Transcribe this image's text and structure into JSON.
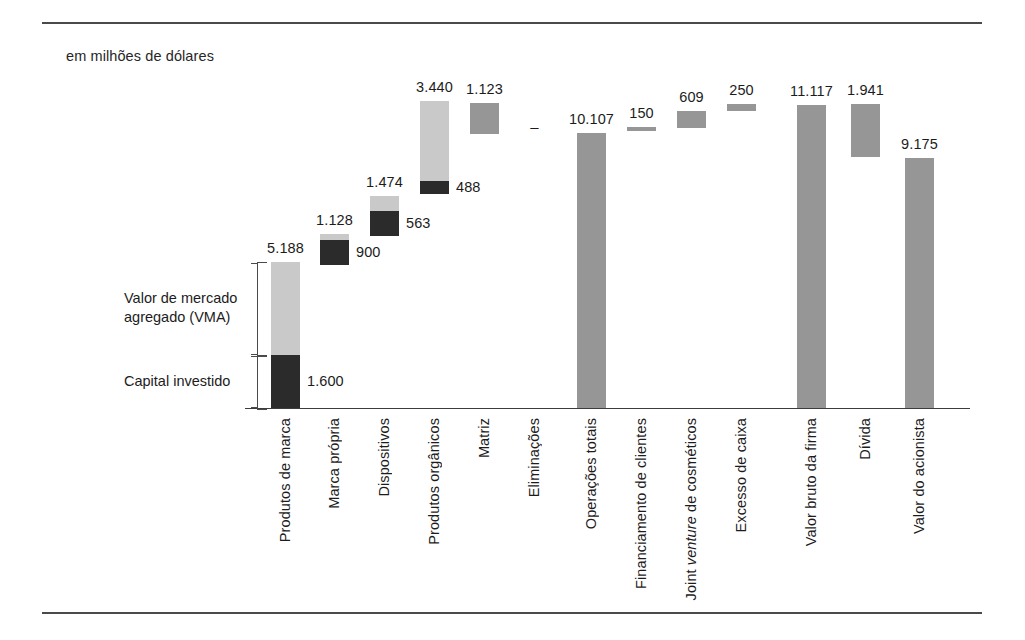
{
  "figure": {
    "unit_note": "em milhões de dólares",
    "baseline_value": 0,
    "legend": [
      {
        "key": "mva",
        "label": "Valor de mercado\nagregado (VMA)",
        "color": "#c9c9c9"
      },
      {
        "key": "cap",
        "label": "Capital investido",
        "color": "#2b2b2b"
      }
    ]
  },
  "chart_data": {
    "type": "bar",
    "title": "",
    "subtitle": "em milhões de dólares",
    "xlabel": "",
    "ylabel": "",
    "ylim": [
      0,
      11117
    ],
    "grid": false,
    "legend_position": "left-inside",
    "stacked": true,
    "value_format": "1.234 (ponto como separador de milhar)",
    "categories": [
      "Produtos de marca",
      "Marca própria",
      "Dispositivos",
      "Produtos orgânicos",
      "Matriz",
      "Eliminações",
      "Operações totais",
      "Financiamento de clientes",
      "Joint venture de cosméticos",
      "Excesso de caixa",
      "Valor bruto da firma",
      "Dívida",
      "Valor do acionista"
    ],
    "series": [
      {
        "name": "Valor de mercado agregado (VMA)",
        "color": "#c9c9c9",
        "values": [
          3588,
          228,
          911,
          2952,
          null,
          null,
          null,
          null,
          null,
          null,
          null,
          null,
          null
        ]
      },
      {
        "name": "Capital investido",
        "color": "#2b2b2b",
        "values": [
          1600,
          900,
          563,
          488,
          null,
          null,
          null,
          null,
          null,
          null,
          null,
          null,
          null
        ]
      },
      {
        "name": "Valor total",
        "color": "#969696",
        "values": [
          null,
          null,
          null,
          null,
          1123,
          0,
          10107,
          150,
          609,
          250,
          11117,
          1941,
          9175
        ]
      }
    ],
    "totals": [
      5188,
      1128,
      1474,
      3440,
      1123,
      0,
      10107,
      150,
      609,
      250,
      11117,
      1941,
      9175
    ],
    "total_labels": [
      "5.188",
      "1.128",
      "1.474",
      "3.440",
      "1.123",
      "–",
      "10.107",
      "150",
      "609",
      "250",
      "11.117",
      "1.941",
      "9.175"
    ],
    "capital_labels": [
      "1.600",
      "900",
      "563",
      "488"
    ],
    "annotations": [
      "Primeiras quatro colunas empilhadas: capital investido (escuro) + VMA (claro)",
      "Eliminações: valor nulo, representado por um traço",
      "Colunas flutuantes à direita representam a ponte de avaliação"
    ]
  },
  "bars": [
    {
      "name": "produtos-de-marca",
      "label": "Produtos de marca",
      "total_label": "5.188",
      "top": 262,
      "bottom": 408,
      "split_y": 355,
      "x": 271,
      "width": 29,
      "kind": "stacked",
      "cap_label": "1.600"
    },
    {
      "name": "marca-propria",
      "label": "Marca própria",
      "total_label": "1.128",
      "top": 234,
      "bottom": 265,
      "split_y": 240,
      "x": 320,
      "width": 29,
      "kind": "stacked",
      "cap_label": "900"
    },
    {
      "name": "dispositivos",
      "label": "Dispositivos",
      "total_label": "1.474",
      "top": 196,
      "bottom": 236,
      "split_y": 211,
      "x": 370,
      "width": 29,
      "kind": "stacked",
      "cap_label": "563"
    },
    {
      "name": "produtos-organicos",
      "label": "Produtos orgânicos",
      "total_label": "3.440",
      "top": 101,
      "bottom": 194,
      "split_y": 181,
      "x": 420,
      "width": 29,
      "kind": "stacked",
      "cap_label": "488"
    },
    {
      "name": "matriz",
      "label": "Matriz",
      "total_label": "1.123",
      "top": 103,
      "bottom": 134,
      "x": 470,
      "width": 29,
      "kind": "plain"
    },
    {
      "name": "eliminacoes",
      "label": "Eliminações",
      "total_label": "–",
      "top": 130,
      "bottom": 130,
      "x": 520,
      "width": 29,
      "kind": "nil"
    },
    {
      "name": "operacoes-totais",
      "label": "Operações totais",
      "total_label": "10.107",
      "top": 133,
      "bottom": 408,
      "x": 577,
      "width": 29,
      "kind": "plain"
    },
    {
      "name": "financiamento-de-clientes",
      "label": "Financiamento de clientes",
      "total_label": "150",
      "top": 127,
      "bottom": 131,
      "x": 627,
      "width": 29,
      "kind": "plain"
    },
    {
      "name": "joint-venture-cosmeticos",
      "label": "Joint venture de cosméticos",
      "total_label": "609",
      "top": 111,
      "bottom": 128,
      "x": 677,
      "width": 29,
      "kind": "plain",
      "italic_word": "venture"
    },
    {
      "name": "excesso-de-caixa",
      "label": "Excesso de caixa",
      "total_label": "250",
      "top": 104,
      "bottom": 111,
      "x": 727,
      "width": 29,
      "kind": "plain"
    },
    {
      "name": "valor-bruto-da-firma",
      "label": "Valor bruto da firma",
      "total_label": "11.117",
      "top": 105,
      "bottom": 408,
      "x": 797,
      "width": 29,
      "kind": "plain"
    },
    {
      "name": "divida",
      "label": "Dívida",
      "total_label": "1.941",
      "top": 104,
      "bottom": 157,
      "x": 851,
      "width": 29,
      "kind": "plain"
    },
    {
      "name": "valor-do-acionista",
      "label": "Valor do acionista",
      "total_label": "9.175",
      "top": 158,
      "bottom": 408,
      "x": 905,
      "width": 29,
      "kind": "plain"
    }
  ]
}
